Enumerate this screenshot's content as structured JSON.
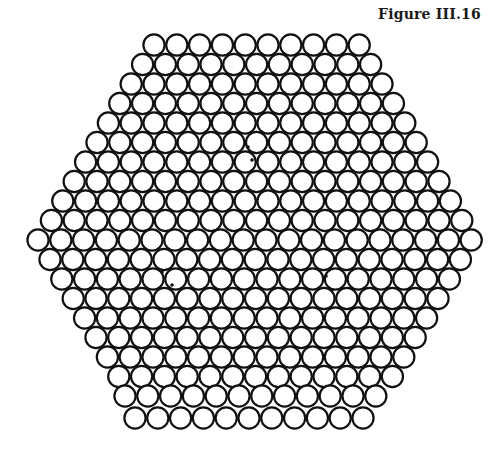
{
  "figure": {
    "title": "Figure III.16"
  },
  "style": {
    "background": "#ffffff",
    "stroke": "#111111",
    "fill": "#ffffff",
    "stroke_width": 2.2,
    "radius": 10.6
  },
  "lattice": {
    "spacing": 22.8,
    "rows": [
      {
        "count": 10,
        "x0": 154.0,
        "y": 45
      },
      {
        "count": 11,
        "x0": 142.6,
        "y": 64.5
      },
      {
        "count": 12,
        "x0": 131.2,
        "y": 84
      },
      {
        "count": 13,
        "x0": 119.8,
        "y": 103.5
      },
      {
        "count": 14,
        "x0": 108.4,
        "y": 123
      },
      {
        "count": 15,
        "x0": 97.0,
        "y": 142.5
      },
      {
        "count": 16,
        "x0": 85.6,
        "y": 162
      },
      {
        "count": 17,
        "x0": 74.2,
        "y": 181.5
      },
      {
        "count": 18,
        "x0": 62.8,
        "y": 201
      },
      {
        "count": 19,
        "x0": 51.4,
        "y": 220.5
      },
      {
        "count": 20,
        "x0": 38.0,
        "y": 240
      },
      {
        "count": 19,
        "x0": 50.0,
        "y": 259.5
      },
      {
        "count": 18,
        "x0": 61.8,
        "y": 279
      },
      {
        "count": 17,
        "x0": 73.2,
        "y": 298.5
      },
      {
        "count": 16,
        "x0": 84.6,
        "y": 318
      },
      {
        "count": 15,
        "x0": 96.0,
        "y": 337.5
      },
      {
        "count": 14,
        "x0": 107.4,
        "y": 357
      },
      {
        "count": 13,
        "x0": 118.8,
        "y": 376.5
      },
      {
        "count": 12,
        "x0": 125.0,
        "y": 396
      },
      {
        "count": 11,
        "x0": 135.0,
        "y": 418
      }
    ]
  },
  "defects": [
    {
      "x": 248,
      "y": 147
    },
    {
      "x": 252,
      "y": 160
    },
    {
      "x": 162,
      "y": 272
    },
    {
      "x": 172,
      "y": 285
    },
    {
      "x": 326,
      "y": 276
    },
    {
      "x": 332,
      "y": 290
    }
  ]
}
